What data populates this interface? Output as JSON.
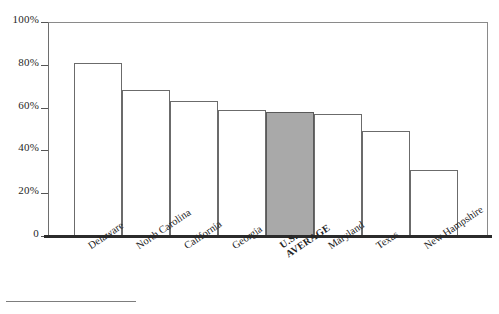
{
  "chart_data": {
    "type": "bar",
    "title": "",
    "xlabel": "",
    "ylabel": "",
    "ylim": [
      0,
      100
    ],
    "grid": false,
    "legend": "none",
    "categories": [
      "Delaware",
      "North Carolina",
      "California",
      "Georgia",
      "U.S. AVERAGE",
      "Maryland",
      "Texas",
      "New Hampshire"
    ],
    "values": [
      81,
      68,
      63,
      59,
      58,
      57,
      49,
      31
    ],
    "ytick_labels": [
      "100%",
      "80%",
      "60%",
      "40%",
      "20%",
      "0"
    ],
    "ytick_values": [
      100,
      80,
      60,
      40,
      20,
      0
    ],
    "highlight_category": "U.S. AVERAGE",
    "highlight_color": "#a9a9a9",
    "bar_color": "#ffffff",
    "bar_edge_color": "#6b6b6b",
    "axis_color": "#2b2b2b"
  },
  "axis": {
    "ticks": [
      {
        "label": "100%",
        "value": 100
      },
      {
        "label": "80%",
        "value": 80
      },
      {
        "label": "60%",
        "value": 60
      },
      {
        "label": "40%",
        "value": 40
      },
      {
        "label": "20%",
        "value": 20
      },
      {
        "label": "0",
        "value": 0
      }
    ]
  },
  "bars": [
    {
      "label": "Delaware",
      "label_line2": "",
      "value": 81,
      "highlight": false
    },
    {
      "label": "North Carolina",
      "label_line2": "",
      "value": 68,
      "highlight": false
    },
    {
      "label": "California",
      "label_line2": "",
      "value": 63,
      "highlight": false
    },
    {
      "label": "Georgia",
      "label_line2": "",
      "value": 59,
      "highlight": false
    },
    {
      "label": "U.S.",
      "label_line2": "AVERAGE",
      "value": 58,
      "highlight": true
    },
    {
      "label": "Maryland",
      "label_line2": "",
      "value": 57,
      "highlight": false
    },
    {
      "label": "Texas",
      "label_line2": "",
      "value": 49,
      "highlight": false
    },
    {
      "label": "New Hampshire",
      "label_line2": "",
      "value": 31,
      "highlight": false
    }
  ]
}
